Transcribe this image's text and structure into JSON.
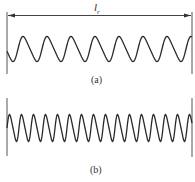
{
  "figure": {
    "length_label": "l",
    "length_label_sub": "r",
    "panel_a": {
      "caption": "(a)",
      "cycles": 7,
      "description": "sinusoidal profile with longer wavelength"
    },
    "panel_b": {
      "caption": "(b)",
      "cycles": 15,
      "description": "sinusoidal profile with shorter wavelength"
    },
    "line_color": "#2a2a2a"
  }
}
